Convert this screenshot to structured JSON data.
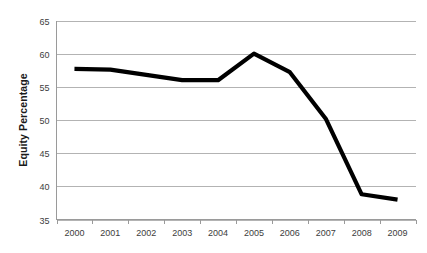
{
  "chart_data": {
    "type": "line",
    "title": "",
    "subtitle": "",
    "xlabel": "",
    "ylabel": "Equity Percentage",
    "categories": [
      "2000",
      "2001",
      "2002",
      "2003",
      "2004",
      "2005",
      "2006",
      "2007",
      "2008",
      "2009"
    ],
    "values": [
      57.7,
      57.6,
      56.8,
      56.0,
      56.0,
      60.0,
      57.2,
      50.2,
      38.8,
      38.0
    ],
    "series": [
      {
        "name": "Equity Percentage",
        "values": [
          57.7,
          57.6,
          56.8,
          56.0,
          56.0,
          60.0,
          57.2,
          50.2,
          38.8,
          38.0
        ],
        "color": "#000000"
      }
    ],
    "ylim": [
      35,
      65
    ],
    "y_ticks": [
      35,
      40,
      45,
      50,
      55,
      60,
      65
    ],
    "y_tick_labels": [
      "35",
      "40",
      "45",
      "50",
      "55",
      "60",
      "65"
    ],
    "x_tick_labels": [
      "2000",
      "2001",
      "2002",
      "2003",
      "2004",
      "2005",
      "2006",
      "2007",
      "2008",
      "2009"
    ],
    "grid": true,
    "grid_axis": "y",
    "legend": false,
    "legend_position": "none",
    "markers": false,
    "annotations": [],
    "colors": {
      "line": "#000000",
      "gridline": "#b3b3b3",
      "axis": "#9a9a9a",
      "tick_label": "#3d3d3d",
      "axis_title": "#1a1a1a",
      "background": "#ffffff"
    }
  }
}
